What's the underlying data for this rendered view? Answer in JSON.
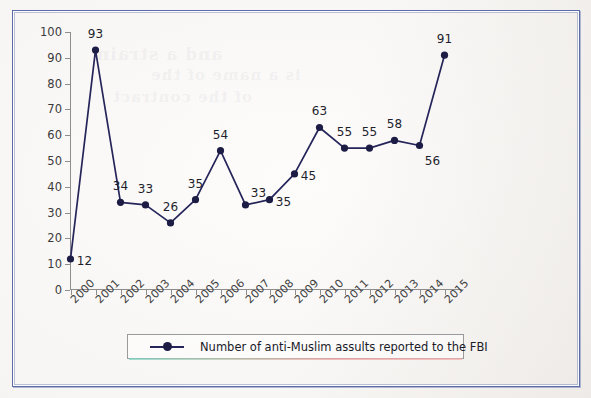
{
  "document": {
    "type": "scanned-page",
    "frame_color": "#5a6ba8",
    "background_color": "#f7f5f3"
  },
  "chart_data": {
    "type": "line",
    "title": "",
    "xlabel": "",
    "ylabel": "",
    "ylim": [
      0,
      100
    ],
    "ytick_step": 10,
    "grid": false,
    "legend_position": "bottom",
    "series_color": "#25255a",
    "marker": "filled-circle",
    "categories": [
      "2000",
      "2001",
      "2002",
      "2003",
      "2004",
      "2005",
      "2006",
      "2007",
      "2008",
      "2009",
      "2010",
      "2011",
      "2012",
      "2013",
      "2014",
      "2015"
    ],
    "values": [
      12,
      93,
      34,
      33,
      26,
      35,
      54,
      33,
      35,
      45,
      63,
      55,
      55,
      58,
      56,
      91
    ],
    "yticks": [
      "0",
      "10",
      "20",
      "30",
      "40",
      "50",
      "60",
      "70",
      "80",
      "90",
      "100"
    ],
    "point_label_placement": [
      "right",
      "above",
      "above",
      "above",
      "above",
      "above",
      "above",
      "above-right",
      "right",
      "right",
      "above",
      "above",
      "above",
      "above",
      "below-right",
      "above"
    ],
    "series": [
      {
        "name": "Number of anti-Muslim assults reported to the FBI",
        "values": [
          12,
          93,
          34,
          33,
          26,
          35,
          54,
          33,
          35,
          45,
          63,
          55,
          55,
          58,
          56,
          91
        ]
      }
    ],
    "legend": [
      "Number of anti-Muslim assults reported to the FBI"
    ]
  },
  "legend": {
    "label": "Number of anti-Muslim assults reported to the FBI"
  },
  "ghost_text": [
    "and a strain",
    "is a name of the",
    "of the contract"
  ]
}
